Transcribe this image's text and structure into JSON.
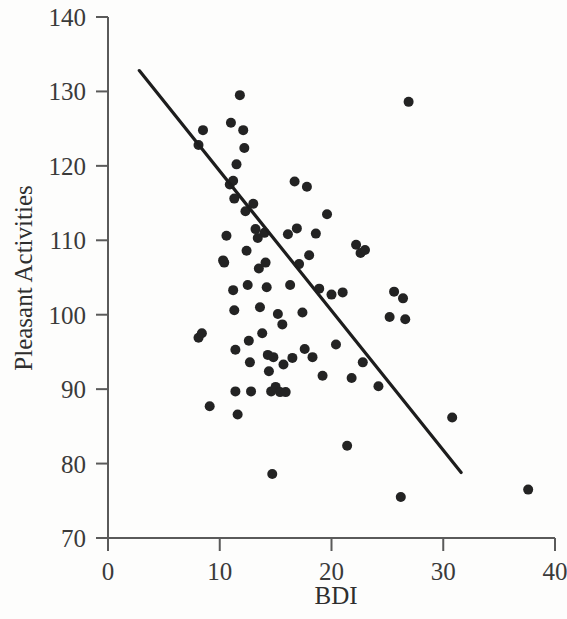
{
  "chart_data": {
    "type": "scatter",
    "title": "",
    "xlabel": "BDI",
    "ylabel": "Pleasant Activities",
    "xlim": [
      0,
      40
    ],
    "ylim": [
      70,
      140
    ],
    "xticks": [
      0,
      10,
      20,
      30,
      40
    ],
    "yticks": [
      70,
      80,
      90,
      100,
      110,
      120,
      130,
      140
    ],
    "xtick_labels": [
      "0",
      "10",
      "20",
      "30",
      "40"
    ],
    "ytick_labels": [
      "70",
      "80",
      "90",
      "100",
      "110",
      "120",
      "130",
      "140"
    ],
    "grid": false,
    "legend": null,
    "point_color": "#232323",
    "point_radius": 5,
    "line_color": "#1d1d1d",
    "series": [
      {
        "name": "Participants",
        "x": [
          8.1,
          8.1,
          8.4,
          8.5,
          9.1,
          10.3,
          10.4,
          10.6,
          10.9,
          11.0,
          11.2,
          11.2,
          11.3,
          11.3,
          11.4,
          11.4,
          11.5,
          11.6,
          11.8,
          12.1,
          12.2,
          12.3,
          12.4,
          12.5,
          12.6,
          12.7,
          12.8,
          13.0,
          13.2,
          13.4,
          13.5,
          13.6,
          13.8,
          14.0,
          14.1,
          14.2,
          14.3,
          14.4,
          14.6,
          14.7,
          14.8,
          15.0,
          15.2,
          15.4,
          15.6,
          15.7,
          15.9,
          16.1,
          16.3,
          16.5,
          16.7,
          16.9,
          17.1,
          17.4,
          17.6,
          17.8,
          18.0,
          18.3,
          18.6,
          18.9,
          19.2,
          19.6,
          20.0,
          20.4,
          21.0,
          21.4,
          21.8,
          22.2,
          22.6,
          22.8,
          23.0,
          24.2,
          25.2,
          25.6,
          26.2,
          26.4,
          26.6,
          26.9,
          30.8,
          37.6
        ],
        "y": [
          122.8,
          96.9,
          97.5,
          124.8,
          87.7,
          107.3,
          107.0,
          110.6,
          117.5,
          125.8,
          118.0,
          103.3,
          115.6,
          100.6,
          95.3,
          89.7,
          120.2,
          86.6,
          129.5,
          124.8,
          122.4,
          113.9,
          108.6,
          104.0,
          96.5,
          93.6,
          89.7,
          114.9,
          111.5,
          110.3,
          106.2,
          101.0,
          97.5,
          111.0,
          107.0,
          103.7,
          94.6,
          92.4,
          89.7,
          78.6,
          94.3,
          90.3,
          100.1,
          89.6,
          98.7,
          93.3,
          89.6,
          110.8,
          104.0,
          94.2,
          117.9,
          111.6,
          106.8,
          100.3,
          95.4,
          117.2,
          108.0,
          94.3,
          110.9,
          103.5,
          91.8,
          113.5,
          102.7,
          96.0,
          103.0,
          82.4,
          91.5,
          109.4,
          108.3,
          93.6,
          108.7,
          90.4,
          99.7,
          103.1,
          75.5,
          102.2,
          99.4,
          128.6,
          86.2,
          76.5
        ]
      }
    ],
    "trend_line": {
      "name": "Least-squares regression line",
      "x_start": 2.8,
      "y_start": 132.8,
      "x_end": 31.6,
      "y_end": 78.8
    }
  }
}
